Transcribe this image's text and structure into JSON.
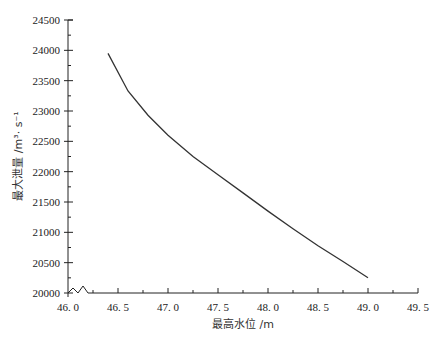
{
  "chart_data": {
    "type": "line",
    "title": "",
    "xlabel": "最高水位 /m",
    "ylabel": "最大泄量 /m³· s⁻¹",
    "xlim": [
      46.0,
      49.5
    ],
    "ylim": [
      20000,
      24500
    ],
    "grid": false,
    "legend": null,
    "x_ticks": [
      "46.0",
      "46.5",
      "47.0",
      "47.5",
      "48.0",
      "48.5",
      "49.0",
      "49.5"
    ],
    "y_ticks": [
      "20000",
      "20500",
      "21000",
      "21500",
      "22000",
      "22500",
      "23000",
      "23500",
      "24000",
      "24500"
    ],
    "axis_break": "zigzag break symbol on x-axis near origin",
    "series": [
      {
        "name": "最大泄量",
        "x": [
          46.4,
          46.6,
          46.8,
          47.0,
          47.25,
          47.5,
          47.75,
          48.0,
          48.25,
          48.5,
          48.75,
          49.0
        ],
        "values": [
          23950,
          23330,
          22930,
          22600,
          22250,
          21950,
          21650,
          21350,
          21060,
          20780,
          20520,
          20250
        ]
      }
    ]
  },
  "axes": {
    "x_title": "最高水位 /m",
    "y_title": "最大泄量 /m³· s⁻¹",
    "x_ticks": [
      "46. 0",
      "46. 5",
      "47. 0",
      "47. 5",
      "48. 0",
      "48. 5",
      "49. 0",
      "49. 5"
    ],
    "y_ticks": [
      "20000",
      "20500",
      "21000",
      "21500",
      "22000",
      "22500",
      "23000",
      "23500",
      "24000",
      "24500"
    ]
  },
  "colors": {
    "line": "#333333",
    "axis": "#222222",
    "background": "#ffffff"
  }
}
